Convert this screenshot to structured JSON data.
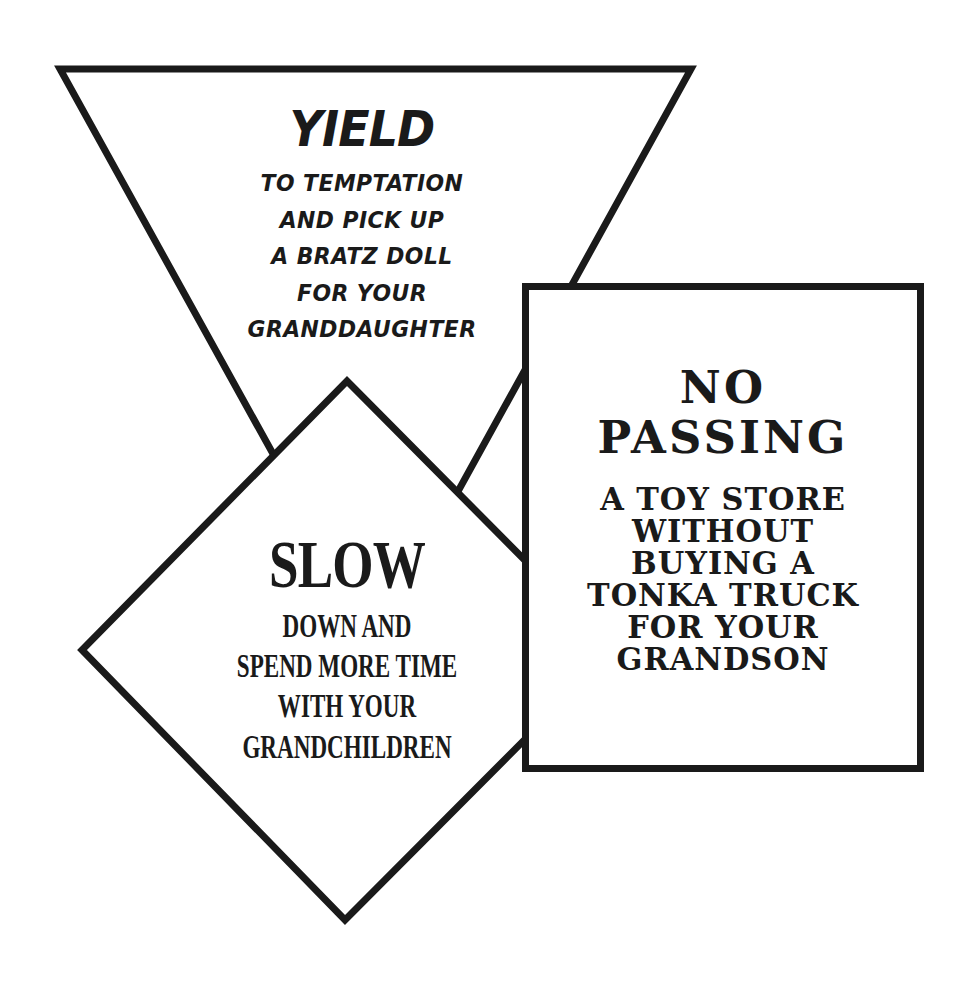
{
  "colors": {
    "stroke": "#1a1a1a",
    "fill": "#ffffff",
    "background": "#ffffff"
  },
  "signs": {
    "yield": {
      "shape": "inverted-triangle",
      "title": "YIELD",
      "lines": [
        "TO TEMPTATION",
        "AND PICK UP",
        "A BRATZ DOLL",
        "FOR YOUR",
        "GRANDDAUGHTER"
      ]
    },
    "slow": {
      "shape": "diamond",
      "title": "SLOW",
      "lines": [
        "DOWN AND",
        "SPEND MORE TIME",
        "WITH YOUR",
        "GRANDCHILDREN"
      ]
    },
    "no_passing": {
      "shape": "rectangle",
      "title_lines": [
        "NO",
        "PASSING"
      ],
      "lines": [
        "A TOY STORE",
        "WITHOUT",
        "BUYING A",
        "TONKA TRUCK",
        "FOR YOUR",
        "GRANDSON"
      ]
    }
  }
}
